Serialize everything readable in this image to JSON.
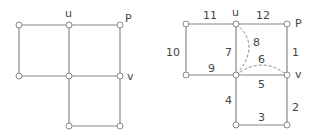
{
  "left_graph": {
    "nodes": [
      {
        "id": "a",
        "x": 19,
        "y": 25
      },
      {
        "id": "u",
        "x": 69,
        "y": 25,
        "label": "u"
      },
      {
        "id": "P",
        "x": 120,
        "y": 25,
        "label": "P"
      },
      {
        "id": "d",
        "x": 19,
        "y": 76
      },
      {
        "id": "c",
        "x": 69,
        "y": 76
      },
      {
        "id": "v",
        "x": 120,
        "y": 76,
        "label": "v"
      },
      {
        "id": "e",
        "x": 69,
        "y": 126
      },
      {
        "id": "f",
        "x": 120,
        "y": 126
      }
    ],
    "labels": {
      "u": "u",
      "P": "P",
      "v": "v"
    }
  },
  "right_graph": {
    "labels": {
      "u": "u",
      "P": "P",
      "v": "v"
    },
    "edge_labels": {
      "e1": "1",
      "e2": "2",
      "e3": "3",
      "e4": "4",
      "e5": "5",
      "e6": "6",
      "e7": "7",
      "e8": "8",
      "e9": "9",
      "e10": "10",
      "e11": "11",
      "e12": "12"
    }
  }
}
